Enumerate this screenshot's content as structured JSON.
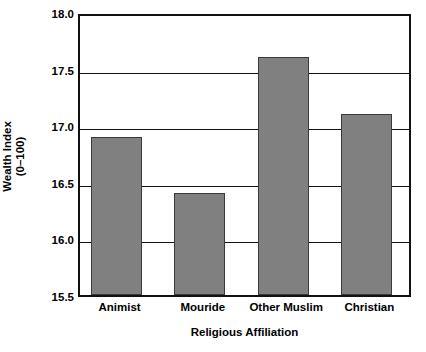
{
  "chart_data": {
    "type": "bar",
    "title": "",
    "subtitle": "",
    "xlabel": "Religious Affiliation",
    "ylabel": "Wealth Index (0–100)",
    "ylabel_lines": [
      "Wealth Index",
      "(0–100)"
    ],
    "categories": [
      "Animist",
      "Mouride",
      "Other Muslim",
      "Christian"
    ],
    "values": [
      16.9,
      16.4,
      17.6,
      17.1
    ],
    "ylim": [
      15.5,
      18.0
    ],
    "ytick_labels": [
      "18.0",
      "17.5",
      "17.0",
      "16.5",
      "16.0",
      "15.5"
    ],
    "ytick_values": [
      18.0,
      17.5,
      17.0,
      16.5,
      16.0,
      15.5
    ],
    "grid": "horizontal",
    "legend": "none",
    "bar_color": "#808080",
    "bar_edge_color": "#3a3a3a",
    "axis_color": "#111111",
    "background_color": "#ffffff"
  }
}
